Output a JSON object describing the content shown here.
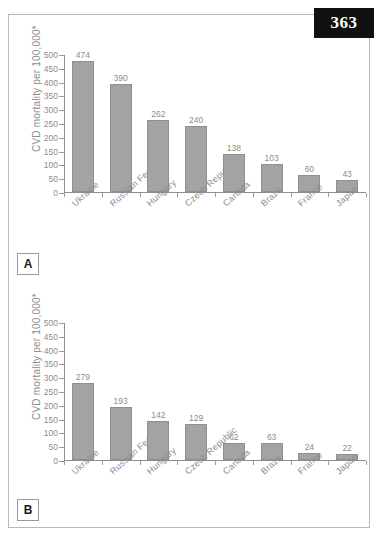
{
  "page": {
    "number": "363"
  },
  "figure": {
    "panels": [
      {
        "letter": "A",
        "chart_index": 0
      },
      {
        "letter": "B",
        "chart_index": 1
      }
    ]
  },
  "chart_data": [
    {
      "type": "bar",
      "panel": "A",
      "title": "",
      "xlabel": "",
      "ylabel": "CVD mortality per 100,000*",
      "ylim": [
        0,
        500
      ],
      "yticks": [
        0,
        50,
        100,
        150,
        200,
        250,
        300,
        350,
        400,
        450,
        500
      ],
      "grid": false,
      "legend": "none",
      "categories": [
        "Ukraine",
        "Russian Fed",
        "Hungary",
        "Czech Republic",
        "Canada",
        "Brazil",
        "France",
        "Japan"
      ],
      "values": [
        474,
        390,
        262,
        240,
        138,
        103,
        60,
        43
      ],
      "bar_color": "#a3a3a3"
    },
    {
      "type": "bar",
      "panel": "B",
      "title": "",
      "xlabel": "",
      "ylabel": "CVD mortality per 100,000*",
      "ylim": [
        0,
        500
      ],
      "yticks": [
        0,
        50,
        100,
        150,
        200,
        250,
        300,
        350,
        400,
        450,
        500
      ],
      "grid": false,
      "legend": "none",
      "categories": [
        "Ukraine",
        "Russian Fed",
        "Hungary",
        "Czech Republic",
        "Canada",
        "Brazil",
        "France",
        "Japan"
      ],
      "values": [
        279,
        193,
        142,
        129,
        62,
        63,
        24,
        22
      ],
      "bar_color": "#a3a3a3"
    }
  ]
}
